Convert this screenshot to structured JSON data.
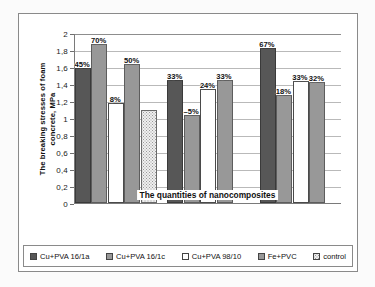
{
  "chart_data": {
    "type": "bar",
    "title": "",
    "xlabel": "The quantities of nanocomposites",
    "ylabel": "The breaking stresses of foam concrete, MPa",
    "ylabel_line1": "The breaking stresses of foam",
    "ylabel_line2": "concrete, MPa",
    "ylim": [
      0,
      2
    ],
    "ytick_labels": [
      "2",
      "1,8",
      "1,6",
      "1,4",
      "1,2",
      "1",
      "0,8",
      "0,6",
      "0,4",
      "0,2",
      "0"
    ],
    "ytick_values": [
      2,
      1.8,
      1.6,
      1.4,
      1.2,
      1,
      0.8,
      0.6,
      0.4,
      0.2,
      0
    ],
    "grid": true,
    "legend_position": "bottom",
    "categories": [
      "group-1",
      "group-2",
      "group-3"
    ],
    "series": [
      {
        "name": "Cu+PVA 16/1a",
        "swatch": "s0",
        "color": "#575757",
        "values": [
          1.59,
          1.45,
          1.82
        ],
        "labels": [
          "45%",
          "33%",
          "67%"
        ]
      },
      {
        "name": "Cu+PVA 16/1c",
        "swatch": "s1",
        "color": "#989898",
        "values": [
          1.87,
          1.03,
          1.27
        ],
        "labels": [
          "70%",
          "–5%",
          "18%"
        ]
      },
      {
        "name": "Cu+PVA 98/10",
        "swatch": "s2",
        "color": "#ffffff",
        "values": [
          1.18,
          1.34,
          1.44
        ],
        "labels": [
          "8%",
          "24%",
          "33%"
        ]
      },
      {
        "name": "Fe+PVC",
        "swatch": "s3",
        "color": "#989898",
        "values": [
          1.64,
          1.45,
          1.42
        ],
        "labels": [
          "50%",
          "33%",
          "32%"
        ]
      },
      {
        "name": "control",
        "swatch": "s4",
        "color": "#efefef",
        "values": [
          1.09,
          null,
          null
        ],
        "labels": [
          "",
          "",
          ""
        ]
      }
    ]
  },
  "legend": {
    "items": [
      {
        "label": "Cu+PVA 16/1a",
        "swatch": "s0"
      },
      {
        "label": "Cu+PVA 16/1c",
        "swatch": "s1"
      },
      {
        "label": "Cu+PVA 98/10",
        "swatch": "s2"
      },
      {
        "label": "Fe+PVC",
        "swatch": "s3"
      },
      {
        "label": "control",
        "swatch": "s4"
      }
    ]
  }
}
